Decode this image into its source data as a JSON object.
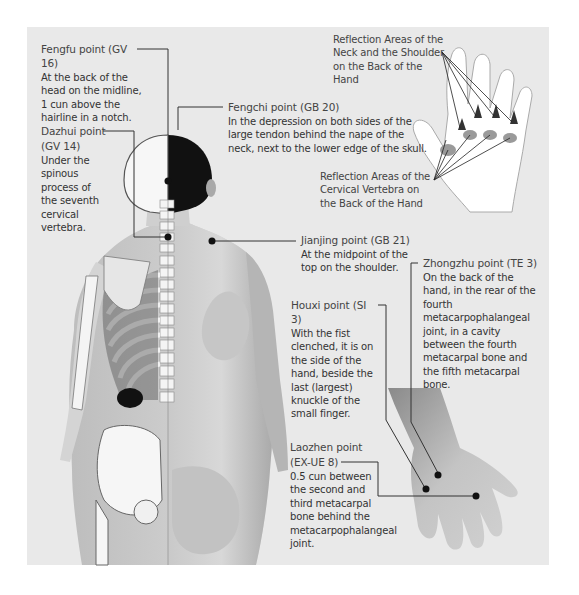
{
  "points": {
    "fengfu": {
      "title": "Fengfu point (GV 16)",
      "desc": "At the back of the head on the midline, 1 cun above the hairline in a notch."
    },
    "dazhui": {
      "title_line1": "Dazhui point",
      "title_line2": "(GV 14)",
      "desc": "Under the spinous process of the seventh cervical vertebra."
    },
    "fengchi": {
      "title": "Fengchi point (GB 20)",
      "desc": "In the depression on both sides of the large tendon behind the nape of the neck, next to the lower edge of the skull."
    },
    "jianjing": {
      "title": "Jianjing point (GB 21)",
      "desc": "At the midpoint of the top on the shoulder."
    },
    "zhongzhu": {
      "title": "Zhongzhu point (TE 3)",
      "desc": "On the back of the hand, in the rear of the fourth metacarpophalangeal joint, in a cavity between the fourth metacarpal bone and the fifth metacarpal bone."
    },
    "houxi": {
      "title": "Houxi point (SI 3)",
      "desc": "With the fist clenched, it is on the side of the hand, beside the last (largest) knuckle of the small finger."
    },
    "laozhen": {
      "title_line1": "Laozhen point",
      "title_line2": "(EX-UE 8)",
      "desc": "0.5 cun between the second and third metacarpal bone behind the metacarpophalangeal joint."
    }
  },
  "reflection": {
    "neck_shoulder": "Reflection Areas of the Neck and the Shoulder on the Back of the Hand",
    "cervical": "Reflection Areas of the Cervical Vertebra on the Back of the Hand"
  },
  "colors": {
    "panel_bg": "#e9e9e9",
    "text": "#333333",
    "leader": "#333333",
    "reflection_area": "#999999"
  }
}
